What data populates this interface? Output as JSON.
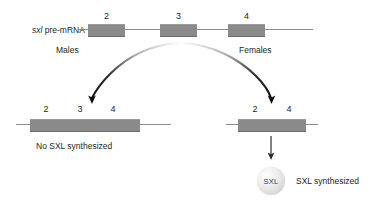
{
  "figure": {
    "transcript_label": "sxl",
    "transcript_label_rest": " pre-mRNA",
    "exon_numbers": [
      "2",
      "3",
      "4"
    ],
    "male_label": "Males",
    "female_label": "Females",
    "male_mrna_exons": [
      "2",
      "3",
      "4"
    ],
    "female_mrna_exons": [
      "2",
      "4"
    ],
    "male_outcome": "No SXL synthesized",
    "female_outcome": "SXL synthesized",
    "protein_name": "SXL",
    "colors": {
      "exon_fill": "#8a8a8a",
      "intron_line": "#8d8d8d",
      "text": "#231f20",
      "arrow": "#1a1a1a",
      "protein_sphere": "#e4e4e4"
    }
  }
}
